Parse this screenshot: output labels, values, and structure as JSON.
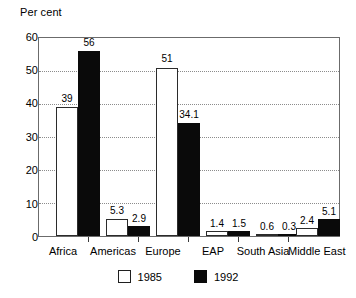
{
  "chart_data": {
    "type": "bar",
    "title": "",
    "ylabel": "Per cent",
    "xlabel": "",
    "categories": [
      "Africa",
      "Americas",
      "Europe",
      "EAP",
      "South Asia",
      "Middle East"
    ],
    "series": [
      {
        "name": "1985",
        "color": "#ffffff",
        "values": [
          39,
          5.3,
          51,
          1.4,
          0.6,
          2.4
        ]
      },
      {
        "name": "1992",
        "color": "#000000",
        "values": [
          56,
          2.9,
          34.1,
          1.5,
          0.3,
          5.1
        ]
      }
    ],
    "value_labels": {
      "1985": [
        "39",
        "5.3",
        "51",
        "1.4",
        "0.6",
        "2.4"
      ],
      "1992": [
        "56",
        "2.9",
        "34.1",
        "1.5",
        "0.3",
        "5.1"
      ]
    },
    "ylim": [
      0,
      60
    ],
    "yticks": [
      0,
      10,
      20,
      30,
      40,
      50,
      60
    ],
    "ytick_labels": [
      "0",
      "10",
      "20",
      "30",
      "40",
      "50",
      "60"
    ],
    "yminor_ticks": [
      5,
      15,
      25,
      35,
      45,
      55
    ],
    "grid": "horizontal-dotted",
    "legend": {
      "position": "bottom-center",
      "entries": [
        {
          "label": "1985",
          "swatch": "white-square"
        },
        {
          "label": "1992",
          "swatch": "black-square"
        }
      ]
    }
  }
}
